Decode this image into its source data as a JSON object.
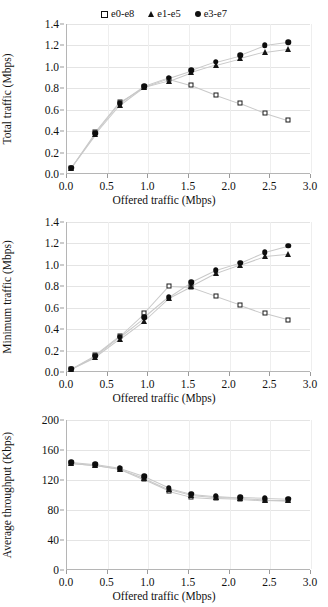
{
  "figure": {
    "legend": {
      "position": "top-center",
      "entries": [
        {
          "label": "e0-e8",
          "marker": "open-square",
          "color": "#1a1a1a"
        },
        {
          "label": "e1-e5",
          "marker": "open-triangle",
          "color": "#141414"
        },
        {
          "label": "e3-e7",
          "marker": "filled-circle",
          "color": "#0d0d0d"
        }
      ]
    }
  },
  "chart_data": [
    {
      "type": "scatter",
      "title": "",
      "xlabel": "Offered traffic (Mbps)",
      "ylabel": "Total traffic (Mbps)",
      "xlim": [
        0.0,
        3.0
      ],
      "ylim": [
        0.0,
        1.4
      ],
      "xticks": [
        "0.0",
        "0.5",
        "1.0",
        "1.5",
        "2.0",
        "2.5",
        "3.0"
      ],
      "yticks": [
        "0.0",
        "0.2",
        "0.4",
        "0.6",
        "0.8",
        "1.0",
        "1.2",
        "1.4"
      ],
      "grid": true,
      "x": [
        0.05,
        0.35,
        0.65,
        0.95,
        1.25,
        1.53,
        1.83,
        2.13,
        2.43,
        2.72
      ],
      "series": [
        {
          "name": "e0-e8",
          "marker": "open-square",
          "values": [
            0.06,
            0.39,
            0.67,
            0.81,
            0.89,
            0.83,
            0.74,
            0.66,
            0.57,
            0.5
          ]
        },
        {
          "name": "e1-e5",
          "marker": "open-triangle",
          "values": [
            0.06,
            0.37,
            0.64,
            0.81,
            0.87,
            0.95,
            1.02,
            1.08,
            1.14,
            1.17
          ]
        },
        {
          "name": "e3-e7",
          "marker": "filled-circle",
          "values": [
            0.06,
            0.38,
            0.66,
            0.82,
            0.9,
            0.97,
            1.05,
            1.11,
            1.2,
            1.23
          ]
        }
      ]
    },
    {
      "type": "scatter",
      "title": "",
      "xlabel": "Offered traffic (Mbps)",
      "ylabel": "Minimum traffic (Mbps)",
      "xlim": [
        0.0,
        3.0
      ],
      "ylim": [
        0.0,
        1.4
      ],
      "xticks": [
        "0.0",
        "0.5",
        "1.0",
        "1.5",
        "2.0",
        "2.5",
        "3.0"
      ],
      "yticks": [
        "0.0",
        "0.2",
        "0.4",
        "0.6",
        "0.8",
        "1.0",
        "1.2",
        "1.4"
      ],
      "grid": true,
      "x": [
        0.05,
        0.35,
        0.65,
        0.95,
        1.25,
        1.53,
        1.83,
        2.13,
        2.43,
        2.72
      ],
      "series": [
        {
          "name": "e0-e8",
          "marker": "open-square",
          "values": [
            0.03,
            0.16,
            0.34,
            0.55,
            0.8,
            0.79,
            0.71,
            0.63,
            0.55,
            0.49
          ]
        },
        {
          "name": "e1-e5",
          "marker": "open-triangle",
          "values": [
            0.03,
            0.14,
            0.31,
            0.48,
            0.69,
            0.8,
            0.92,
            1.0,
            1.08,
            1.1
          ]
        },
        {
          "name": "e3-e7",
          "marker": "filled-circle",
          "values": [
            0.03,
            0.15,
            0.33,
            0.51,
            0.7,
            0.84,
            0.95,
            1.02,
            1.12,
            1.18
          ]
        }
      ]
    },
    {
      "type": "scatter",
      "title": "",
      "xlabel": "Offered traffic (Mbps)",
      "ylabel": "Average throughput (Kbps)",
      "xlim": [
        0.0,
        3.0
      ],
      "ylim": [
        0,
        200
      ],
      "xticks": [
        "0.0",
        "0.5",
        "1.0",
        "1.5",
        "2.0",
        "2.5",
        "3.0"
      ],
      "yticks": [
        "0",
        "40",
        "80",
        "120",
        "160",
        "200"
      ],
      "grid": true,
      "x": [
        0.05,
        0.35,
        0.65,
        0.95,
        1.25,
        1.53,
        1.83,
        2.13,
        2.43,
        2.72
      ],
      "series": [
        {
          "name": "e0-e8",
          "marker": "open-square",
          "values": [
            143,
            140,
            135,
            121,
            106,
            98,
            96,
            95,
            93,
            93
          ]
        },
        {
          "name": "e1-e5",
          "marker": "open-triangle",
          "values": [
            143,
            140,
            135,
            123,
            108,
            100,
            97,
            96,
            94,
            93
          ]
        },
        {
          "name": "e3-e7",
          "marker": "filled-circle",
          "values": [
            144,
            141,
            136,
            125,
            110,
            102,
            99,
            97,
            96,
            95
          ]
        }
      ]
    }
  ]
}
